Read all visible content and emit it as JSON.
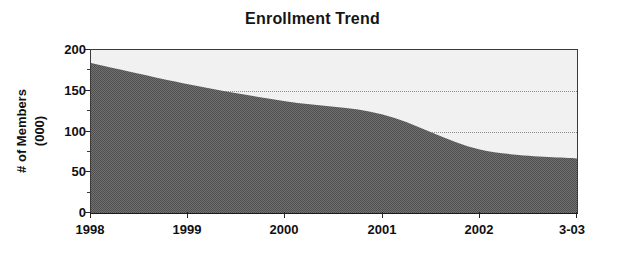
{
  "chart_data": {
    "type": "area",
    "title": "Enrollment Trend",
    "xlabel": "",
    "ylabel": "# of Members (000)",
    "ylabel_lines": [
      "# of Members",
      "(000)"
    ],
    "categories": [
      "1998",
      "1999",
      "2000",
      "2001",
      "2002",
      "3-03"
    ],
    "values": [
      184,
      158,
      137,
      121,
      78,
      67
    ],
    "series": [
      {
        "name": "# of Members (000)",
        "values": [
          184,
          158,
          137,
          121,
          78,
          67
        ]
      }
    ],
    "x": [
      0,
      1,
      2,
      3,
      4,
      5
    ],
    "xlim": [
      0,
      5
    ],
    "ylim": [
      0,
      200
    ],
    "yticks": [
      0,
      50,
      100,
      150,
      200
    ],
    "ytick_labels": [
      "0",
      "50",
      "100",
      "150",
      "200"
    ],
    "xtick_labels": [
      "1998",
      "1999",
      "2000",
      "2001",
      "2002",
      "3-03"
    ],
    "grid": "horizontal-dotted",
    "gridlines_at": [
      100,
      150
    ],
    "legend": "none",
    "colors": {
      "area_fill": "#5a5a5a",
      "plot_background": "#f1f1f1",
      "axis": "#262626",
      "gridline": "#8d8d8d",
      "text": "#101010"
    }
  }
}
